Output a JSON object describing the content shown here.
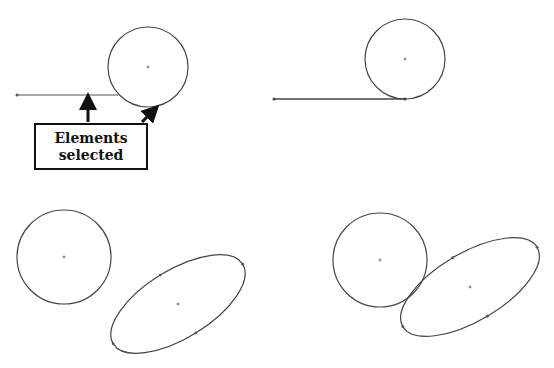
{
  "figure": {
    "panels": [
      {
        "id": "top-left",
        "description": "Line and circle before constraint",
        "line": {
          "x1": 17,
          "y1": 95,
          "x2": 118,
          "y2": 95
        },
        "circle": {
          "cx": 148,
          "cy": 67,
          "r": 40
        },
        "callout": {
          "line1": "Elements",
          "line2": "selected"
        }
      },
      {
        "id": "top-right",
        "description": "Line tangent to circle after constraint",
        "line": {
          "x1": 274,
          "y1": 99,
          "x2": 405,
          "y2": 99
        },
        "circle": {
          "cx": 405,
          "cy": 59,
          "r": 40
        }
      },
      {
        "id": "bottom-left",
        "description": "Circle and ellipse before constraint",
        "circle": {
          "cx": 64,
          "cy": 257,
          "r": 47
        },
        "ellipse": {
          "cx": 178,
          "cy": 304,
          "rx": 76,
          "ry": 34,
          "angle": -31.6
        }
      },
      {
        "id": "bottom-right",
        "description": "Circle tangent to ellipse after constraint",
        "circle": {
          "cx": 380,
          "cy": 260,
          "r": 47
        },
        "ellipse": {
          "cx": 470,
          "cy": 287,
          "rx": 78,
          "ry": 34,
          "angle": -30.6
        }
      }
    ],
    "colors": {
      "stroke": "#444444",
      "arrow": "#111111",
      "background": "#ffffff"
    }
  }
}
